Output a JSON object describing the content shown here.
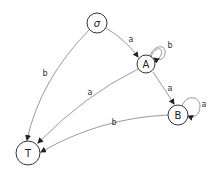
{
  "diagram": {
    "type": "state-machine",
    "nodes": [
      {
        "id": "sigma",
        "label": "σ",
        "x": 97,
        "y": 23,
        "r": 10
      },
      {
        "id": "A",
        "label": "A",
        "x": 146,
        "y": 64,
        "r": 9
      },
      {
        "id": "B",
        "label": "B",
        "x": 178,
        "y": 115,
        "r": 10
      },
      {
        "id": "T",
        "label": "T",
        "x": 28,
        "y": 153,
        "r": 12
      }
    ],
    "edges": [
      {
        "from": "sigma",
        "to": "A",
        "label": "a"
      },
      {
        "from": "sigma",
        "to": "T",
        "label": "b"
      },
      {
        "from": "A",
        "to": "A",
        "label": "b"
      },
      {
        "from": "A",
        "to": "B",
        "label": "a"
      },
      {
        "from": "A",
        "to": "T",
        "label": "a"
      },
      {
        "from": "B",
        "to": "B",
        "label": "a"
      },
      {
        "from": "B",
        "to": "T",
        "label": "b"
      }
    ]
  }
}
